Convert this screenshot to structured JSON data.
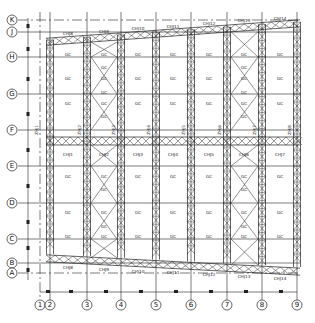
{
  "drawing": {
    "type": "structural-grid-plan",
    "row_axes": [
      "K",
      "J",
      "H",
      "G",
      "F",
      "E",
      "D",
      "C",
      "B",
      "A"
    ],
    "column_axes": [
      "1",
      "2",
      "3",
      "4",
      "5",
      "6",
      "7",
      "8",
      "9"
    ],
    "top_truss_labels": [
      "CHJ8",
      "CHJ9",
      "CHJ10",
      "CHJ11",
      "CHJ12",
      "CHJ13",
      "CHJ14"
    ],
    "bottom_truss_labels": [
      "CHJ8",
      "CHJ9",
      "CHJ10",
      "CHJ11",
      "CHJ12",
      "CHJ13",
      "CHJ14"
    ],
    "middle_truss_labels": [
      "CHJ1",
      "CHJ2",
      "CHJ3",
      "CHJ4",
      "CHJ5",
      "CHJ6",
      "CHJ7"
    ],
    "column_truss_labels": [
      "ZHJ1",
      "ZHJ2",
      "ZHJ3",
      "ZHJ4",
      "ZHJ5",
      "ZHJ6",
      "ZHJ7",
      "ZHJ8"
    ],
    "brace_label": "GC",
    "line_color": "#222222",
    "background_color": "#ffffff"
  }
}
